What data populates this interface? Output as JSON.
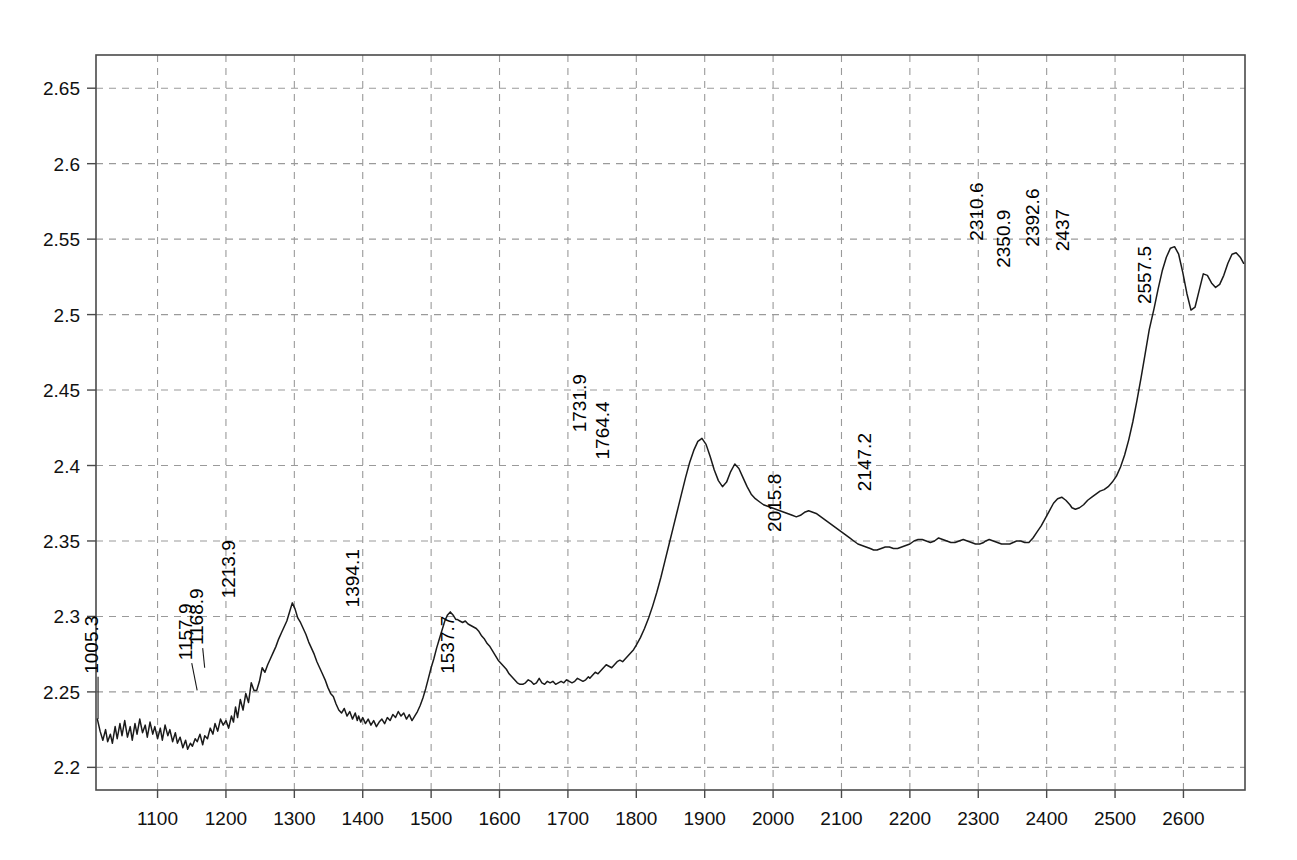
{
  "chart_data": {
    "type": "line",
    "title": "",
    "subtitle": "",
    "xlabel": "",
    "ylabel": "",
    "xlim": [
      1010,
      2690
    ],
    "ylim": [
      2.185,
      2.672
    ],
    "grid": true,
    "legend": "none",
    "xticks": [
      1100,
      1200,
      1300,
      1400,
      1500,
      1600,
      1700,
      1800,
      1900,
      2000,
      2100,
      2200,
      2300,
      2400,
      2500,
      2600
    ],
    "yticks": [
      2.2,
      2.25,
      2.3,
      2.35,
      2.4,
      2.45,
      2.5,
      2.55,
      2.6,
      2.65
    ],
    "xtick_labels": [
      "1100",
      "1200",
      "1300",
      "1400",
      "1500",
      "1600",
      "1700",
      "1800",
      "1900",
      "2000",
      "2100",
      "2200",
      "2300",
      "2400",
      "2500",
      "2600"
    ],
    "ytick_labels": [
      "2.2",
      "2.25",
      "2.3",
      "2.35",
      "2.4",
      "2.45",
      "2.5",
      "2.55",
      "2.6",
      "2.65"
    ],
    "line_color": "#1a1a1a",
    "grid_color": "#9a9a9a",
    "frame_color": "#4a4a4a",
    "annotations": [
      {
        "label": "1005.3",
        "x": 1013,
        "y": 2.232,
        "label_x": 1013,
        "label_y": 2.262
      },
      {
        "label": "1157.9",
        "x": 1157.9,
        "y": 2.251,
        "label_x": 1150,
        "label_y": 2.271
      },
      {
        "label": "1168.9",
        "x": 1168.9,
        "y": 2.266,
        "label_x": 1166,
        "label_y": 2.281
      },
      {
        "label": "1213.9",
        "x": 1213.9,
        "y": 2.309,
        "label_x": 1213.9,
        "label_y": 2.312
      },
      {
        "label": "1394.1",
        "x": 1394.1,
        "y": 2.303,
        "label_x": 1394.1,
        "label_y": 2.306
      },
      {
        "label": "1537.7",
        "x": 1537.7,
        "y": 2.259,
        "label_x": 1533,
        "label_y": 2.262
      },
      {
        "label": "1731.9",
        "x": 1731.9,
        "y": 2.418,
        "label_x": 1727,
        "label_y": 2.422
      },
      {
        "label": "1764.4",
        "x": 1764.4,
        "y": 2.401,
        "label_x": 1760,
        "label_y": 2.404
      },
      {
        "label": "2015.8",
        "x": 2015.8,
        "y": 2.352,
        "label_x": 2011,
        "label_y": 2.356
      },
      {
        "label": "2147.2",
        "x": 2147.2,
        "y": 2.379,
        "label_x": 2143,
        "label_y": 2.383
      },
      {
        "label": "2310.6",
        "x": 2310.6,
        "y": 2.545,
        "label_x": 2307,
        "label_y": 2.549
      },
      {
        "label": "2350.9",
        "x": 2350.9,
        "y": 2.527,
        "label_x": 2347,
        "label_y": 2.531
      },
      {
        "label": "2392.6",
        "x": 2392.6,
        "y": 2.541,
        "label_x": 2389,
        "label_y": 2.545
      },
      {
        "label": "2437",
        "x": 2437,
        "y": 2.538,
        "label_x": 2433,
        "label_y": 2.542
      },
      {
        "label": "2557.5",
        "x": 2557.5,
        "y": 2.503,
        "label_x": 2553,
        "label_y": 2.507
      }
    ],
    "x": [
      1012,
      1016,
      1020,
      1024,
      1027,
      1031,
      1034,
      1038,
      1041,
      1045,
      1048,
      1052,
      1056,
      1060,
      1063,
      1067,
      1070,
      1074,
      1078,
      1082,
      1085,
      1089,
      1093,
      1096,
      1100,
      1104,
      1107,
      1111,
      1115,
      1118,
      1122,
      1126,
      1129,
      1133,
      1137,
      1141,
      1144,
      1148,
      1151,
      1155,
      1158,
      1162,
      1166,
      1169,
      1173,
      1177,
      1181,
      1184,
      1188,
      1192,
      1196,
      1200,
      1204,
      1208,
      1211,
      1214,
      1217,
      1221,
      1225,
      1229,
      1233,
      1237,
      1241,
      1245,
      1249,
      1253,
      1257,
      1261,
      1265,
      1269,
      1273,
      1277,
      1281,
      1285,
      1289,
      1293,
      1297,
      1301,
      1305,
      1309,
      1313,
      1317,
      1321,
      1325,
      1329,
      1333,
      1337,
      1341,
      1345,
      1349,
      1353,
      1357,
      1361,
      1365,
      1369,
      1373,
      1377,
      1381,
      1385,
      1389,
      1392,
      1394,
      1397,
      1400,
      1404,
      1408,
      1412,
      1416,
      1420,
      1424,
      1428,
      1432,
      1436,
      1440,
      1444,
      1448,
      1452,
      1456,
      1460,
      1464,
      1468,
      1472,
      1476,
      1480,
      1484,
      1488,
      1492,
      1496,
      1500,
      1504,
      1508,
      1512,
      1516,
      1520,
      1524,
      1528,
      1532,
      1536,
      1538,
      1542,
      1546,
      1550,
      1554,
      1558,
      1562,
      1566,
      1570,
      1574,
      1578,
      1582,
      1586,
      1590,
      1594,
      1598,
      1602,
      1606,
      1610,
      1614,
      1618,
      1622,
      1626,
      1630,
      1634,
      1638,
      1642,
      1646,
      1650,
      1654,
      1658,
      1662,
      1666,
      1670,
      1674,
      1678,
      1682,
      1686,
      1690,
      1694,
      1698,
      1702,
      1706,
      1710,
      1714,
      1718,
      1722,
      1726,
      1730,
      1732,
      1736,
      1740,
      1744,
      1748,
      1752,
      1756,
      1760,
      1764,
      1768,
      1772,
      1776,
      1780,
      1784,
      1788,
      1792,
      1796,
      1800,
      1806,
      1812,
      1818,
      1824,
      1830,
      1836,
      1842,
      1848,
      1854,
      1860,
      1866,
      1872,
      1878,
      1884,
      1890,
      1896,
      1902,
      1908,
      1914,
      1920,
      1926,
      1932,
      1938,
      1944,
      1950,
      1956,
      1962,
      1968,
      1974,
      1980,
      1986,
      1992,
      1998,
      2004,
      2010,
      2016,
      2022,
      2028,
      2034,
      2040,
      2046,
      2052,
      2058,
      2064,
      2070,
      2076,
      2082,
      2088,
      2094,
      2100,
      2106,
      2112,
      2118,
      2124,
      2130,
      2136,
      2142,
      2147,
      2152,
      2158,
      2164,
      2170,
      2176,
      2182,
      2188,
      2194,
      2200,
      2206,
      2212,
      2218,
      2224,
      2230,
      2236,
      2242,
      2248,
      2254,
      2260,
      2266,
      2272,
      2278,
      2284,
      2290,
      2296,
      2302,
      2308,
      2311,
      2316,
      2322,
      2328,
      2334,
      2340,
      2346,
      2351,
      2356,
      2362,
      2368,
      2374,
      2380,
      2386,
      2392,
      2398,
      2404,
      2410,
      2416,
      2422,
      2428,
      2434,
      2437,
      2442,
      2448,
      2454,
      2460,
      2466,
      2472,
      2478,
      2484,
      2490,
      2496,
      2502,
      2508,
      2514,
      2520,
      2526,
      2532,
      2538,
      2544,
      2550,
      2557,
      2563,
      2569,
      2575,
      2581,
      2587,
      2593,
      2599,
      2605,
      2611,
      2617,
      2623,
      2629,
      2635,
      2641,
      2647,
      2653,
      2659,
      2665,
      2671,
      2677,
      2683,
      2688
    ],
    "y": [
      2.232,
      2.224,
      2.218,
      2.225,
      2.217,
      2.222,
      2.216,
      2.227,
      2.219,
      2.229,
      2.221,
      2.231,
      2.22,
      2.227,
      2.218,
      2.229,
      2.222,
      2.232,
      2.223,
      2.228,
      2.22,
      2.23,
      2.222,
      2.227,
      2.219,
      2.226,
      2.218,
      2.228,
      2.221,
      2.225,
      2.217,
      2.223,
      2.216,
      2.22,
      2.213,
      2.218,
      2.212,
      2.216,
      2.214,
      2.219,
      2.217,
      2.222,
      2.215,
      2.221,
      2.219,
      2.226,
      2.222,
      2.229,
      2.224,
      2.232,
      2.228,
      2.231,
      2.226,
      2.234,
      2.23,
      2.24,
      2.233,
      2.245,
      2.238,
      2.249,
      2.243,
      2.256,
      2.251,
      2.251,
      2.257,
      2.266,
      2.263,
      2.268,
      2.272,
      2.276,
      2.28,
      2.285,
      2.289,
      2.293,
      2.297,
      2.303,
      2.309,
      2.305,
      2.299,
      2.296,
      2.292,
      2.288,
      2.283,
      2.279,
      2.275,
      2.27,
      2.266,
      2.262,
      2.258,
      2.253,
      2.249,
      2.247,
      2.242,
      2.238,
      2.236,
      2.239,
      2.234,
      2.237,
      2.232,
      2.236,
      2.231,
      2.234,
      2.23,
      2.233,
      2.229,
      2.232,
      2.228,
      2.231,
      2.227,
      2.23,
      2.232,
      2.229,
      2.233,
      2.231,
      2.235,
      2.233,
      2.237,
      2.234,
      2.236,
      2.232,
      2.235,
      2.231,
      2.234,
      2.237,
      2.241,
      2.246,
      2.252,
      2.259,
      2.266,
      2.272,
      2.279,
      2.285,
      2.291,
      2.297,
      2.301,
      2.303,
      2.301,
      2.298,
      2.298,
      2.297,
      2.296,
      2.297,
      2.295,
      2.294,
      2.293,
      2.292,
      2.29,
      2.287,
      2.285,
      2.282,
      2.28,
      2.277,
      2.274,
      2.271,
      2.269,
      2.267,
      2.265,
      2.262,
      2.26,
      2.258,
      2.256,
      2.255,
      2.255,
      2.256,
      2.258,
      2.257,
      2.255,
      2.256,
      2.259,
      2.256,
      2.255,
      2.257,
      2.256,
      2.257,
      2.255,
      2.256,
      2.257,
      2.256,
      2.258,
      2.257,
      2.256,
      2.257,
      2.259,
      2.258,
      2.257,
      2.258,
      2.26,
      2.259,
      2.261,
      2.263,
      2.262,
      2.264,
      2.266,
      2.268,
      2.267,
      2.266,
      2.268,
      2.27,
      2.271,
      2.27,
      2.272,
      2.274,
      2.276,
      2.278,
      2.281,
      2.286,
      2.292,
      2.299,
      2.307,
      2.316,
      2.326,
      2.337,
      2.348,
      2.359,
      2.37,
      2.381,
      2.392,
      2.402,
      2.41,
      2.416,
      2.418,
      2.414,
      2.406,
      2.397,
      2.39,
      2.386,
      2.389,
      2.396,
      2.401,
      2.398,
      2.392,
      2.386,
      2.381,
      2.378,
      2.376,
      2.374,
      2.373,
      2.372,
      2.371,
      2.37,
      2.369,
      2.368,
      2.367,
      2.366,
      2.367,
      2.369,
      2.37,
      2.369,
      2.368,
      2.366,
      2.364,
      2.362,
      2.36,
      2.358,
      2.356,
      2.354,
      2.352,
      2.35,
      2.348,
      2.347,
      2.346,
      2.345,
      2.344,
      2.344,
      2.345,
      2.346,
      2.346,
      2.345,
      2.345,
      2.346,
      2.347,
      2.348,
      2.35,
      2.351,
      2.351,
      2.35,
      2.349,
      2.35,
      2.352,
      2.351,
      2.35,
      2.349,
      2.349,
      2.35,
      2.351,
      2.35,
      2.349,
      2.348,
      2.348,
      2.349,
      2.35,
      2.351,
      2.35,
      2.349,
      2.348,
      2.348,
      2.348,
      2.349,
      2.35,
      2.35,
      2.349,
      2.349,
      2.352,
      2.356,
      2.36,
      2.365,
      2.37,
      2.375,
      2.378,
      2.379,
      2.377,
      2.374,
      2.372,
      2.371,
      2.372,
      2.374,
      2.377,
      2.379,
      2.381,
      2.383,
      2.384,
      2.386,
      2.389,
      2.393,
      2.399,
      2.407,
      2.417,
      2.429,
      2.443,
      2.458,
      2.474,
      2.49,
      2.504,
      2.517,
      2.529,
      2.538,
      2.544,
      2.545,
      2.54,
      2.528,
      2.514,
      2.503,
      2.505,
      2.516,
      2.527,
      2.526,
      2.521,
      2.518,
      2.52,
      2.526,
      2.534,
      2.54,
      2.541,
      2.538,
      2.534,
      2.533,
      2.535,
      2.538,
      2.539,
      2.538,
      2.538,
      2.536,
      2.532,
      2.527,
      2.521,
      2.515,
      2.51,
      2.506,
      2.502,
      2.499,
      2.496,
      2.494,
      2.493,
      2.494,
      2.497,
      2.5,
      2.502,
      2.503,
      2.502,
      2.5,
      2.499,
      2.5,
      2.5,
      2.499,
      2.498,
      2.496,
      2.494,
      2.492,
      2.491,
      2.49,
      2.49,
      2.491,
      2.494,
      2.498,
      2.503,
      2.51,
      2.518,
      2.527,
      2.536,
      2.544,
      2.546
    ]
  }
}
